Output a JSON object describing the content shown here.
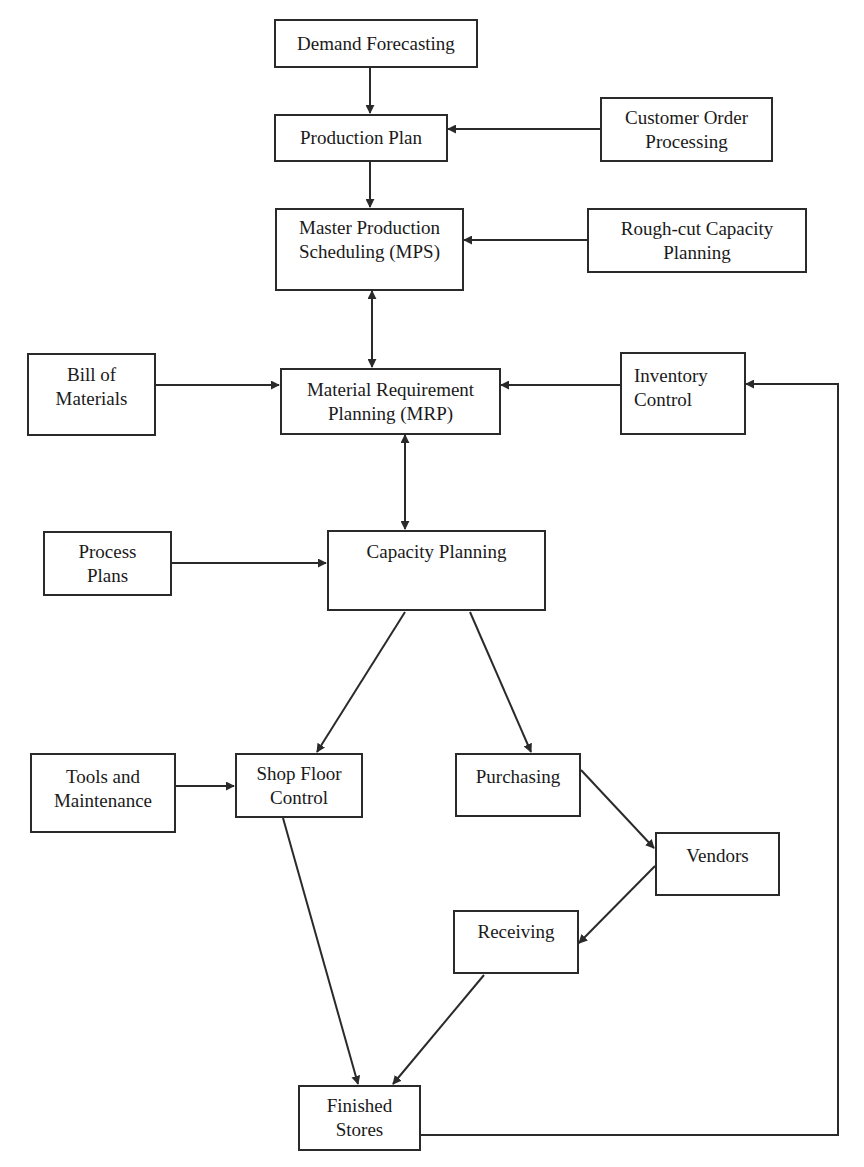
{
  "diagram": {
    "type": "flowchart",
    "title": "",
    "nodes": {
      "demand_forecasting": {
        "lines": [
          "Demand Forecasting"
        ]
      },
      "production_plan": {
        "lines": [
          "Production Plan"
        ]
      },
      "customer_order_processing": {
        "lines": [
          "Customer Order",
          "Processing"
        ]
      },
      "mps": {
        "lines": [
          "Master Production",
          "Scheduling (MPS)"
        ]
      },
      "rough_cut_capacity_planning": {
        "lines": [
          "Rough-cut Capacity",
          "Planning"
        ]
      },
      "bill_of_materials": {
        "lines": [
          "Bill of",
          "Materials"
        ]
      },
      "mrp": {
        "lines": [
          "Material Requirement",
          "Planning (MRP)"
        ]
      },
      "inventory_control": {
        "lines": [
          "Inventory",
          "Control"
        ]
      },
      "process_plans": {
        "lines": [
          "Process",
          "Plans"
        ]
      },
      "capacity_planning": {
        "lines": [
          "Capacity Planning"
        ]
      },
      "tools_and_maintenance": {
        "lines": [
          "Tools and",
          "Maintenance"
        ]
      },
      "shop_floor_control": {
        "lines": [
          "Shop Floor",
          "Control"
        ]
      },
      "purchasing": {
        "lines": [
          "Purchasing"
        ]
      },
      "vendors": {
        "lines": [
          "Vendors"
        ]
      },
      "receiving": {
        "lines": [
          "Receiving"
        ]
      },
      "finished_stores": {
        "lines": [
          "Finished",
          "Stores"
        ]
      }
    },
    "edges": [
      {
        "from": "Demand Forecasting",
        "to": "Production Plan",
        "direction": "one-way"
      },
      {
        "from": "Customer Order Processing",
        "to": "Production Plan",
        "direction": "one-way"
      },
      {
        "from": "Production Plan",
        "to": "Master Production Scheduling (MPS)",
        "direction": "one-way"
      },
      {
        "from": "Rough-cut Capacity Planning",
        "to": "Master Production Scheduling (MPS)",
        "direction": "one-way"
      },
      {
        "from": "Master Production Scheduling (MPS)",
        "to": "Material Requirement Planning (MRP)",
        "direction": "two-way"
      },
      {
        "from": "Bill of Materials",
        "to": "Material Requirement Planning (MRP)",
        "direction": "one-way"
      },
      {
        "from": "Inventory Control",
        "to": "Material Requirement Planning (MRP)",
        "direction": "one-way"
      },
      {
        "from": "Material Requirement Planning (MRP)",
        "to": "Capacity Planning",
        "direction": "two-way"
      },
      {
        "from": "Process Plans",
        "to": "Capacity Planning",
        "direction": "one-way"
      },
      {
        "from": "Capacity Planning",
        "to": "Shop Floor Control",
        "direction": "one-way"
      },
      {
        "from": "Capacity Planning",
        "to": "Purchasing",
        "direction": "one-way"
      },
      {
        "from": "Tools and Maintenance",
        "to": "Shop Floor Control",
        "direction": "one-way"
      },
      {
        "from": "Purchasing",
        "to": "Vendors",
        "direction": "one-way"
      },
      {
        "from": "Vendors",
        "to": "Receiving",
        "direction": "one-way"
      },
      {
        "from": "Shop Floor Control",
        "to": "Finished Stores",
        "direction": "one-way"
      },
      {
        "from": "Receiving",
        "to": "Finished Stores",
        "direction": "one-way"
      },
      {
        "from": "Finished Stores",
        "to": "Inventory Control",
        "direction": "one-way"
      }
    ],
    "colors": {
      "line": "#2a2a2a",
      "background": "#ffffff",
      "text": "#1a1a1a"
    }
  }
}
